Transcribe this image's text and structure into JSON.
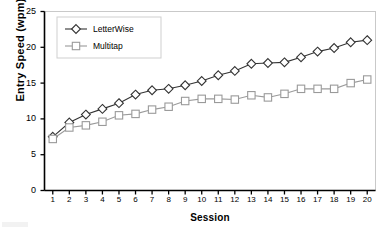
{
  "chart_data": {
    "type": "line",
    "title": "",
    "xlabel": "Session",
    "ylabel": "Entry Speed (wpm)",
    "x": [
      1,
      2,
      3,
      4,
      5,
      6,
      7,
      8,
      9,
      10,
      11,
      12,
      13,
      14,
      15,
      16,
      17,
      18,
      19,
      20
    ],
    "categories": [
      "1",
      "2",
      "3",
      "4",
      "5",
      "6",
      "7",
      "8",
      "9",
      "10",
      "11",
      "12",
      "13",
      "14",
      "15",
      "16",
      "17",
      "18",
      "19",
      "20"
    ],
    "xlim": [
      0.5,
      20.5
    ],
    "ylim": [
      0,
      25
    ],
    "yticks": [
      0,
      5,
      10,
      15,
      20,
      25
    ],
    "ytick_labels": [
      "0",
      "5",
      "10",
      "15",
      "20",
      "25"
    ],
    "grid": false,
    "legend_position": "upper left",
    "series": [
      {
        "name": "LetterWise",
        "marker": "diamond",
        "color": "#333333",
        "values": [
          7.5,
          9.5,
          10.6,
          11.4,
          12.2,
          13.4,
          14.0,
          14.2,
          14.7,
          15.3,
          16.1,
          16.7,
          17.7,
          17.8,
          17.9,
          18.6,
          19.4,
          19.9,
          20.7,
          21.0
        ]
      },
      {
        "name": "Multitap",
        "marker": "square",
        "color": "#9a9a9a",
        "values": [
          7.2,
          8.8,
          9.1,
          9.6,
          10.5,
          10.7,
          11.3,
          11.7,
          12.5,
          12.8,
          12.8,
          12.7,
          13.3,
          13.0,
          13.5,
          14.2,
          14.2,
          14.2,
          15.0,
          15.5
        ]
      }
    ]
  },
  "legend": {
    "entries": [
      {
        "label": "LetterWise"
      },
      {
        "label": "Multitap"
      }
    ]
  },
  "axes": {
    "y_title": "Entry Speed (wpm)",
    "x_title": "Session"
  }
}
